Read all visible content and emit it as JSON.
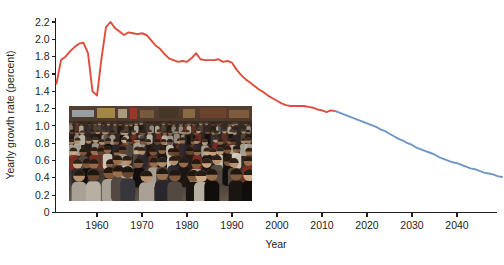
{
  "chart_data": {
    "type": "line",
    "title": "",
    "xlabel": "Year",
    "ylabel": "Yearly growth rate (percent)",
    "xlim": [
      1951,
      2050
    ],
    "ylim": [
      0,
      2.3
    ],
    "xticks": [
      1960,
      1970,
      1980,
      1990,
      2000,
      2010,
      2020,
      2030,
      2040
    ],
    "xtick_labels": [
      "1960",
      "1970",
      "1980",
      "1990",
      "2000",
      "2010",
      "2020",
      "2030",
      "2040"
    ],
    "yticks": [
      0,
      0.2,
      0.4,
      0.6,
      0.8,
      1.0,
      1.2,
      1.4,
      1.6,
      1.8,
      2.0,
      2.2
    ],
    "ytick_labels": [
      "0",
      "0.2",
      "0.4",
      "0.6",
      "0.8",
      "1.0",
      "1.2",
      "1.4",
      "1.6",
      "1.8",
      "2.0",
      "2.2"
    ],
    "grid": false,
    "legend": "none",
    "series": [
      {
        "name": "Estimates",
        "color": "#de4c3c",
        "x": [
          1951,
          1952,
          1953,
          1954,
          1955,
          1956,
          1957,
          1958,
          1959,
          1960,
          1961,
          1962,
          1963,
          1964,
          1965,
          1966,
          1967,
          1968,
          1969,
          1970,
          1971,
          1972,
          1973,
          1974,
          1975,
          1976,
          1977,
          1978,
          1979,
          1980,
          1981,
          1982,
          1983,
          1984,
          1985,
          1986,
          1987,
          1988,
          1989,
          1990,
          1991,
          1992,
          1993,
          1994,
          1995,
          1996,
          1997,
          1998,
          1999,
          2000,
          2001,
          2002,
          2003,
          2004,
          2005,
          2006,
          2007,
          2008,
          2009,
          2010,
          2011,
          2012,
          2013
        ],
        "values": [
          1.49,
          1.76,
          1.8,
          1.86,
          1.91,
          1.95,
          1.96,
          1.84,
          1.4,
          1.35,
          1.78,
          2.14,
          2.2,
          2.13,
          2.09,
          2.05,
          2.08,
          2.07,
          2.06,
          2.07,
          2.05,
          1.99,
          1.93,
          1.89,
          1.83,
          1.78,
          1.76,
          1.74,
          1.75,
          1.74,
          1.78,
          1.84,
          1.77,
          1.76,
          1.76,
          1.76,
          1.77,
          1.74,
          1.75,
          1.73,
          1.65,
          1.59,
          1.54,
          1.5,
          1.46,
          1.42,
          1.39,
          1.35,
          1.32,
          1.29,
          1.26,
          1.24,
          1.23,
          1.23,
          1.23,
          1.23,
          1.22,
          1.21,
          1.19,
          1.18,
          1.16,
          1.18,
          1.17
        ],
        "style": "solid"
      },
      {
        "name": "Projection",
        "color": "#7096c5",
        "x": [
          2013,
          2014,
          2015,
          2016,
          2017,
          2018,
          2019,
          2020,
          2021,
          2022,
          2023,
          2024,
          2025,
          2026,
          2027,
          2028,
          2029,
          2030,
          2031,
          2032,
          2033,
          2034,
          2035,
          2036,
          2037,
          2038,
          2039,
          2040,
          2041,
          2042,
          2043,
          2044,
          2045,
          2046,
          2047,
          2048,
          2049,
          2050
        ],
        "values": [
          1.17,
          1.15,
          1.13,
          1.11,
          1.09,
          1.07,
          1.05,
          1.03,
          1.01,
          0.99,
          0.96,
          0.94,
          0.91,
          0.88,
          0.85,
          0.83,
          0.8,
          0.78,
          0.75,
          0.73,
          0.71,
          0.69,
          0.67,
          0.64,
          0.62,
          0.6,
          0.58,
          0.57,
          0.55,
          0.53,
          0.51,
          0.5,
          0.48,
          0.46,
          0.45,
          0.44,
          0.42,
          0.41
        ],
        "style": "solid"
      }
    ],
    "annotations": [
      {
        "type": "image-inset",
        "name": "crowd-photo",
        "description": "Photograph of a dense crowd of people filling a city street"
      }
    ]
  },
  "colors": {
    "estimates": "#de4c3c",
    "projection": "#7096c5",
    "axis": "#231f20",
    "background": "#ffffff"
  }
}
